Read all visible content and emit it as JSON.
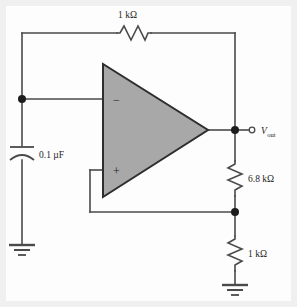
{
  "figure": {
    "background_color": "#f0f0f0",
    "panel_color": "#fdfdfd",
    "wire_color": "#4a4a4a",
    "opamp_fill": "#a8a8a8",
    "opamp_stroke": "#2e2e2e",
    "node_color": "#1d1d1d",
    "text_color": "#1d1d1d"
  },
  "components": {
    "feedback_resistor": {
      "label": "1 kΩ",
      "value": "1",
      "unit": "kΩ",
      "orientation": "horizontal",
      "symbol": "resistor-zigzag"
    },
    "input_capacitor": {
      "label": "0.1 µF",
      "value": "0.1",
      "unit": "µF",
      "orientation": "vertical",
      "symbol": "capacitor-curved-plate"
    },
    "upper_divider_resistor": {
      "label": "6.8 kΩ",
      "value": "6.8",
      "unit": "kΩ",
      "orientation": "vertical",
      "symbol": "resistor-zigzag"
    },
    "lower_divider_resistor": {
      "label": "1 kΩ",
      "value": "1",
      "unit": "kΩ",
      "orientation": "vertical",
      "symbol": "resistor-zigzag"
    },
    "opamp": {
      "symbol": "triangle-amplifier",
      "inverting_input_label": "−",
      "non_inverting_input_label": "+"
    }
  },
  "terminals": {
    "output": {
      "symbol_prefix": "V",
      "symbol_subscript": "out",
      "label": "Vout",
      "terminal_symbol": "open-circle"
    }
  },
  "grounds": [
    {
      "id": "ground-input",
      "symbol": "earth-ground-3-bar"
    },
    {
      "id": "ground-divider",
      "symbol": "earth-ground-3-bar"
    }
  ],
  "nodes": [
    {
      "id": "node-inverting-input",
      "symbol": "filled-dot"
    },
    {
      "id": "node-output",
      "symbol": "filled-dot"
    },
    {
      "id": "node-divider-tap",
      "symbol": "filled-dot"
    }
  ]
}
